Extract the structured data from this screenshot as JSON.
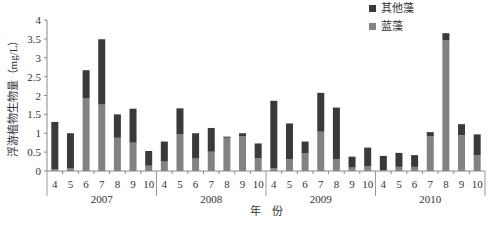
{
  "chart_data": {
    "type": "bar",
    "stacked": true,
    "title": "",
    "xlabel": "年　份",
    "ylabel": "浮游植物生物量（mg/L）",
    "ylim": [
      0,
      4
    ],
    "yticks": [
      "0",
      "0.5",
      "1",
      "1.5",
      "2",
      "2.5",
      "3",
      "3.5",
      "4"
    ],
    "grid": false,
    "legend_position": "top-right",
    "groups": [
      "2007",
      "2008",
      "2009",
      "2010"
    ],
    "months": [
      "4",
      "5",
      "6",
      "7",
      "8",
      "9",
      "10"
    ],
    "categories": [
      "2007-4",
      "2007-5",
      "2007-6",
      "2007-7",
      "2007-8",
      "2007-9",
      "2007-10",
      "2008-4",
      "2008-5",
      "2008-6",
      "2008-7",
      "2008-8",
      "2008-9",
      "2008-10",
      "2009-4",
      "2009-5",
      "2009-6",
      "2009-7",
      "2009-8",
      "2009-9",
      "2009-10",
      "2010-4",
      "2010-5",
      "2010-6",
      "2010-7",
      "2010-8",
      "2010-9",
      "2010-10"
    ],
    "series": [
      {
        "name": "蓝藻",
        "color": "#828282",
        "values": [
          0.05,
          0.08,
          1.92,
          1.76,
          0.88,
          0.75,
          0.14,
          0.25,
          0.97,
          0.33,
          0.51,
          0.88,
          0.92,
          0.34,
          0.07,
          0.31,
          0.47,
          1.04,
          0.31,
          0.09,
          0.13,
          0.02,
          0.11,
          0.11,
          0.92,
          3.46,
          0.95,
          0.42
        ]
      },
      {
        "name": "其他藻",
        "color": "#3a3a3a",
        "values": [
          1.25,
          0.92,
          0.75,
          1.73,
          0.62,
          0.9,
          0.39,
          0.53,
          0.69,
          0.67,
          0.63,
          0.03,
          0.08,
          0.39,
          1.79,
          0.95,
          0.31,
          1.03,
          1.37,
          0.29,
          0.49,
          0.38,
          0.37,
          0.31,
          0.11,
          0.19,
          0.29,
          0.55
        ]
      }
    ]
  },
  "legend": [
    {
      "label": "其他藻",
      "color": "#3a3a3a"
    },
    {
      "label": "蓝藻",
      "color": "#828282"
    }
  ]
}
